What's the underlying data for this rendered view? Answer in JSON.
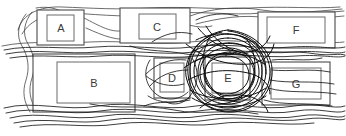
{
  "canvas": {
    "width": 346,
    "height": 136,
    "background": "#ffffff",
    "title": "Hand-drawn sketch of seven labeled rectangles overlaid with pen scribbles"
  },
  "style": {
    "box_outline_color": "#4a4a4a",
    "box_inner_color": "#6a6a6a",
    "box_fill": "#ffffff",
    "label_color": "#3a3a3a",
    "scribble_color": "#1a1a1a",
    "scribble_light_color": "#3c3c3c",
    "scribble_dense_color": "#0d0d0d"
  },
  "boxes": [
    {
      "label": "A",
      "row": "top",
      "outer": {
        "x": 37,
        "y": 10,
        "w": 47,
        "h": 35
      },
      "inner": {
        "x": 47,
        "y": 15,
        "w": 27,
        "h": 26
      },
      "label_x": 61,
      "label_y": 28,
      "font_size": 11,
      "scribble_density": "light"
    },
    {
      "label": "C",
      "row": "top",
      "outer": {
        "x": 120,
        "y": 8,
        "w": 70,
        "h": 35
      },
      "inner": {
        "x": 139,
        "y": 14,
        "w": 37,
        "h": 25
      },
      "label_x": 157,
      "label_y": 27,
      "font_size": 11,
      "scribble_density": "light"
    },
    {
      "label": "F",
      "row": "top",
      "outer": {
        "x": 258,
        "y": 12,
        "w": 77,
        "h": 36
      },
      "inner": {
        "x": 267,
        "y": 17,
        "w": 58,
        "h": 26
      },
      "label_x": 296,
      "label_y": 30,
      "font_size": 11,
      "scribble_density": "none"
    },
    {
      "label": "B",
      "row": "bottom",
      "outer": {
        "x": 33,
        "y": 54,
        "w": 102,
        "h": 58
      },
      "inner": {
        "x": 57,
        "y": 62,
        "w": 73,
        "h": 41
      },
      "label_x": 94,
      "label_y": 83,
      "font_size": 11,
      "scribble_density": "none"
    },
    {
      "label": "D",
      "row": "bottom",
      "outer": {
        "x": 154,
        "y": 58,
        "w": 36,
        "h": 40
      },
      "inner": {
        "x": 160,
        "y": 63,
        "w": 24,
        "h": 29
      },
      "label_x": 172,
      "label_y": 78,
      "font_size": 11,
      "scribble_density": "medium"
    },
    {
      "label": "E",
      "row": "bottom",
      "outer": {
        "x": 205,
        "y": 57,
        "w": 45,
        "h": 43
      },
      "inner": {
        "x": 212,
        "y": 63,
        "w": 31,
        "h": 30
      },
      "label_x": 228,
      "label_y": 78,
      "font_size": 11,
      "scribble_density": "heavy"
    },
    {
      "label": "G",
      "row": "bottom",
      "outer": {
        "x": 262,
        "y": 62,
        "w": 68,
        "h": 43
      },
      "inner": {
        "x": 271,
        "y": 68,
        "w": 50,
        "h": 31
      },
      "label_x": 296,
      "label_y": 84,
      "font_size": 11,
      "scribble_density": "none"
    }
  ],
  "scribbles": {
    "top_sweeps": [
      "M 18 30 C 22 14, 40 6, 62 7 C 90 8, 120 10, 150 8 C 185 6, 220 10, 250 8 C 285 6, 315 9, 340 7",
      "M 22 34 C 30 20, 48 12, 72 13 C 104 15, 132 18, 162 14 C 196 10, 232 16, 262 13 C 292 10, 320 14, 344 11",
      "M 84 18 C 100 26, 112 34, 126 30 C 140 26, 150 18, 166 20 C 184 22, 196 30, 212 26",
      "M 86 28 C 104 36, 118 42, 134 38 C 148 34, 158 24, 174 26",
      "M 190 16 C 212 8, 238 6, 262 10 C 288 14, 312 12, 342 9",
      "M 196 24 C 220 18, 244 14, 268 18 C 296 22, 320 18, 344 16",
      "M 2 46 C 30 40, 60 44, 90 42 C 124 40, 156 46, 190 42 C 226 38, 258 44, 290 42 C 316 40, 332 44, 344 42"
    ],
    "mid_band": [
      "M 4 50 C 32 44, 64 50, 96 47 C 130 44, 160 51, 192 47 C 228 42, 260 50, 292 47 C 318 45, 334 50, 345 47",
      "M 6 54 C 36 48, 66 55, 98 52 C 132 49, 162 56, 194 52 C 230 47, 262 55, 294 52 C 320 50, 336 55, 345 52",
      "M 10 58 C 40 53, 70 59, 100 56 C 134 53, 164 60, 196 56 C 232 51, 264 59, 296 56 C 322 54, 338 59, 345 56",
      "M 130 46 C 148 52, 166 50, 186 54 C 208 58, 230 52, 252 56",
      "M 250 50 C 272 54, 294 50, 316 54 C 330 56, 340 53, 345 55"
    ],
    "bottom_waves": [
      "M 4 108 C 34 100, 66 112, 98 106 C 132 100, 164 112, 196 106 C 230 100, 262 112, 294 106 C 318 102, 334 110, 345 106",
      "M 6 113 C 36 105, 68 117, 100 111 C 134 105, 166 117, 198 111 C 232 105, 264 117, 296 111 C 320 107, 336 115, 345 111",
      "M 10 118 C 40 110, 72 122, 104 116 C 138 110, 170 122, 202 116 C 236 110, 268 122, 300 116 C 322 112, 338 120, 345 116",
      "M 14 123 C 46 116, 78 126, 110 120 C 144 114, 176 126, 208 120 C 242 114, 274 124, 306 119 C 326 116, 340 122, 345 119",
      "M 20 127 C 54 121, 86 129, 118 124 C 152 119, 184 128, 216 124 C 250 119, 282 127, 314 123",
      "M 90 104 C 118 110, 146 104, 174 110 C 202 116, 230 108, 258 114"
    ],
    "left_edge": [
      "M 26 14 C 18 24, 16 36, 22 46 C 28 56, 30 68, 26 80 C 22 92, 24 102, 30 112",
      "M 32 12 C 24 22, 22 34, 28 44 C 34 54, 36 66, 32 78 C 28 90, 30 100, 36 110",
      "M 36 8 C 46 6, 58 8, 66 14"
    ],
    "box_d_loops": [
      "M 150 60 C 142 72, 146 86, 156 94 C 166 102, 180 100, 188 92",
      "M 192 58 C 200 70, 198 86, 190 96 C 184 104, 174 106, 166 102",
      "M 146 76 C 156 84, 170 88, 184 84",
      "M 148 96 C 160 104, 176 104, 190 98"
    ],
    "dense_cluster": [
      "M 228 34 C 250 34, 266 50, 266 70 C 266 92, 250 108, 228 108 C 206 108, 190 92, 190 70 C 190 50, 206 34, 228 34 Z",
      "M 228 38 C 248 38, 262 53, 262 71 C 262 90, 248 104, 228 104 C 208 104, 194 90, 194 71 C 194 53, 208 38, 228 38 Z",
      "M 229 43 C 247 42, 259 56, 259 72 C 259 89, 246 101, 229 101 C 211 101, 198 88, 198 72 C 198 56, 211 43, 229 43 Z",
      "M 227 48 C 244 47, 255 59, 255 73 C 255 88, 243 99, 227 99 C 211 99, 200 87, 200 73 C 200 59, 211 48, 227 48 Z",
      "M 230 52 C 245 52, 254 62, 254 74 C 254 87, 244 96, 230 96 C 215 96, 205 86, 205 74 C 205 62, 215 52, 230 52 Z",
      "M 226 56 C 240 56, 249 64, 249 75 C 249 86, 239 94, 226 94 C 213 94, 204 85, 204 75 C 204 64, 213 56, 226 56 Z",
      "M 228 30 C 252 32, 270 48, 272 68 C 274 90, 258 110, 234 112 C 210 114, 190 98, 186 76 C 183 56, 202 32, 228 30 Z",
      "M 222 32 C 200 36, 186 54, 188 74 C 190 96, 208 112, 230 111 C 252 110, 270 94, 270 72 C 270 52, 252 33, 228 31",
      "M 196 40 C 216 30, 244 32, 258 46",
      "M 192 52 C 212 40, 244 40, 262 54",
      "M 194 62 C 214 50, 246 50, 264 64",
      "M 190 90 C 210 102, 246 102, 266 88",
      "M 192 98 C 212 110, 246 110, 266 96",
      "M 198 28 C 208 40, 222 50, 240 52 C 256 54, 266 46, 270 36",
      "M 206 26 C 214 40, 230 52, 248 54",
      "M 186 44 C 204 58, 226 66, 250 64 C 264 62, 272 54, 274 44",
      "M 188 80 C 206 70, 230 68, 252 74 C 264 78, 270 86, 270 94",
      "M 200 108 C 212 98, 230 92, 248 96 C 260 99, 266 106, 268 112",
      "M 184 68 C 196 58, 214 52, 232 54",
      "M 240 36 C 256 44, 266 58, 266 74",
      "M 212 34 C 202 48, 200 66, 208 82 C 214 94, 226 102, 240 102",
      "M 246 38 C 256 52, 258 70, 250 86 C 244 98, 232 104, 218 104"
    ],
    "cluster_tails": [
      "M 186 60 C 170 58, 156 64, 146 74",
      "M 188 70 C 172 70, 158 76, 150 86",
      "M 272 60 C 288 58, 306 62, 322 58",
      "M 272 70 C 290 72, 310 68, 330 72",
      "M 270 80 C 290 84, 312 80, 334 84",
      "M 268 88 C 288 94, 312 90, 336 94",
      "M 190 100 C 174 104, 158 100, 144 106",
      "M 264 100 C 284 106, 308 102, 332 106",
      "M 196 20 C 208 14, 224 12, 238 16",
      "M 192 34 C 178 30, 164 34, 152 42"
    ]
  }
}
